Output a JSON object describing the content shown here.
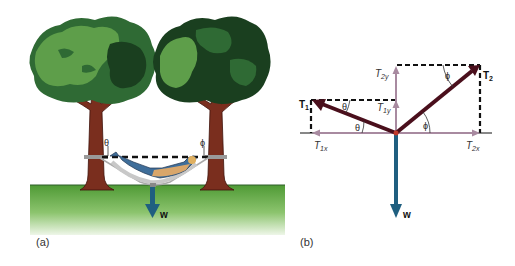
{
  "panel_a": {
    "caption": "(a)",
    "theta_label": "θ",
    "phi_label": "ϕ",
    "weight_label": "w"
  },
  "panel_b": {
    "caption": "(b)",
    "T1_label": "T",
    "T1_sub": "1",
    "T2_label": "T",
    "T2_sub": "2",
    "T1x_label": "T",
    "T1x_sub": "1x",
    "T2x_label": "T",
    "T2x_sub": "2x",
    "T1y_label": "T",
    "T1y_sub": "1y",
    "T2y_label": "T",
    "T2y_sub": "2y",
    "theta_label": "θ",
    "phi_label": "ϕ",
    "weight_label": "w"
  },
  "colors": {
    "tree_light": "#5e9e4a",
    "tree_mid": "#2f6a34",
    "tree_dark": "#1a3f1f",
    "trunk": "#7a2e1e",
    "grass": "#5aa03c",
    "weight_arrow": "#1f5f80",
    "tension_arrow": "#4a0f1c",
    "component_arrow": "#a88aa0"
  }
}
